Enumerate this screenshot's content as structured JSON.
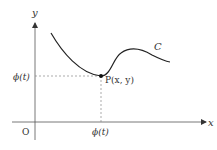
{
  "diagram": {
    "axes": {
      "x_label": "x",
      "y_label": "y",
      "origin_label": "O"
    },
    "curve": {
      "label": "C"
    },
    "point": {
      "label": "P(x, y)"
    },
    "ticks": {
      "x_tick_label": "ϕ(t)",
      "y_tick_label": "ϕ(t)"
    },
    "colors": {
      "axis": "#555555",
      "curve": "#222222",
      "dashed": "#888888",
      "text": "#333333"
    }
  }
}
